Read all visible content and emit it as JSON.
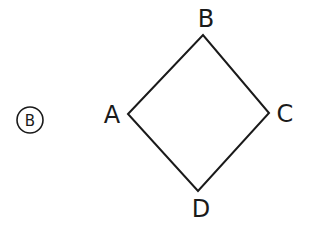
{
  "diagram": {
    "type": "quadrilateral",
    "shape": "square-rotated-45",
    "stroke_color": "#1a1a1a",
    "background": "#ffffff",
    "choice_marker": {
      "label": "B",
      "style": "circled"
    },
    "vertices": [
      {
        "name": "A",
        "label": "A",
        "position": "left"
      },
      {
        "name": "B",
        "label": "B",
        "position": "top"
      },
      {
        "name": "C",
        "label": "C",
        "position": "right"
      },
      {
        "name": "D",
        "label": "D",
        "position": "bottom"
      }
    ],
    "edges": [
      {
        "from": "A",
        "to": "B"
      },
      {
        "from": "B",
        "to": "C"
      },
      {
        "from": "C",
        "to": "D"
      },
      {
        "from": "D",
        "to": "A"
      }
    ]
  }
}
